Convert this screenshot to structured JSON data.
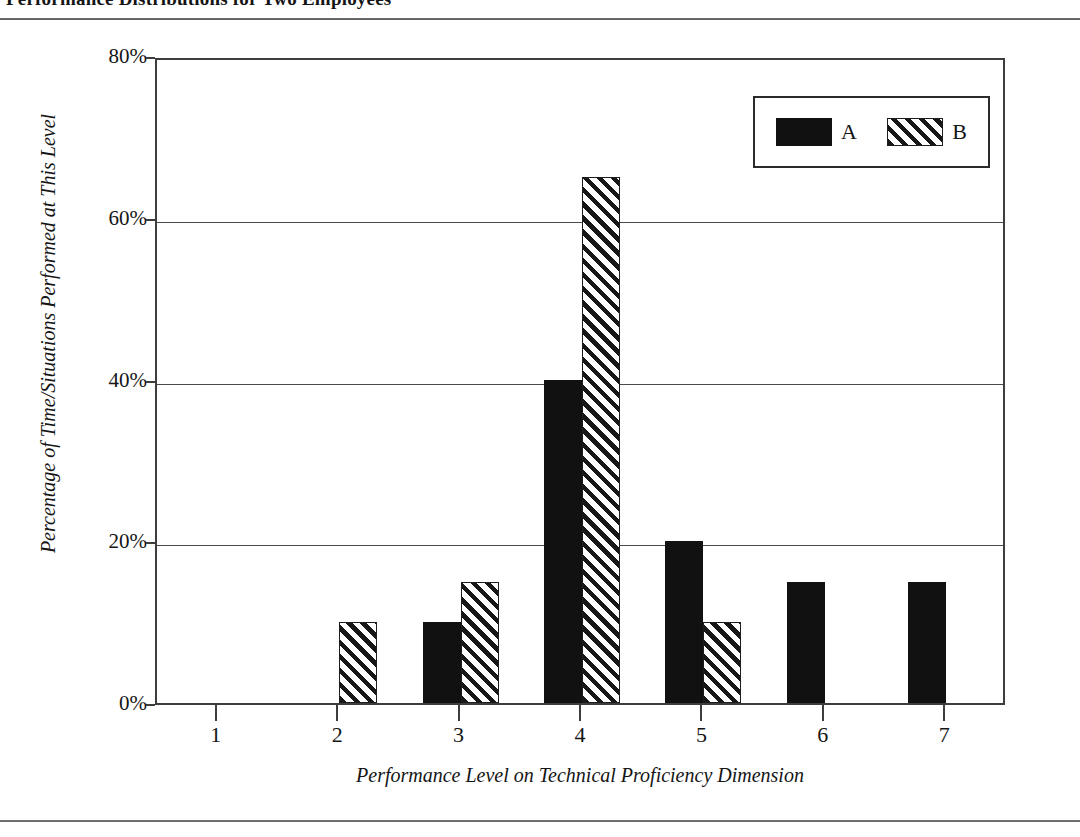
{
  "figure": {
    "title": "Performance Distributions for Two Employees",
    "title_note": "clipped at top edge of scan"
  },
  "chart_data": {
    "type": "bar",
    "title": "Performance Distributions for Two Employees",
    "xlabel": "Performance Level on Technical Proficiency Dimension",
    "ylabel": "Percentage of Time/Situations Performed at This Level",
    "categories": [
      "1",
      "2",
      "3",
      "4",
      "5",
      "6",
      "7"
    ],
    "series": [
      {
        "name": "A",
        "fill": "solid-black",
        "color": "#111111",
        "values": [
          0,
          0,
          10,
          40,
          20,
          15,
          15
        ]
      },
      {
        "name": "B",
        "fill": "diagonal-hatch",
        "color": "#171717",
        "values": [
          0,
          10,
          15,
          65,
          10,
          0,
          0
        ]
      }
    ],
    "ylim": [
      0,
      80
    ],
    "yticks": [
      0,
      20,
      40,
      60,
      80
    ],
    "ytick_labels": [
      "0%",
      "20%",
      "40%",
      "60%",
      "80%"
    ],
    "grid": true,
    "grid_axis": "y",
    "legend_position": "top-right",
    "value_suffix": "%"
  },
  "legend": {
    "entries": [
      {
        "label": "A"
      },
      {
        "label": "B"
      }
    ]
  }
}
